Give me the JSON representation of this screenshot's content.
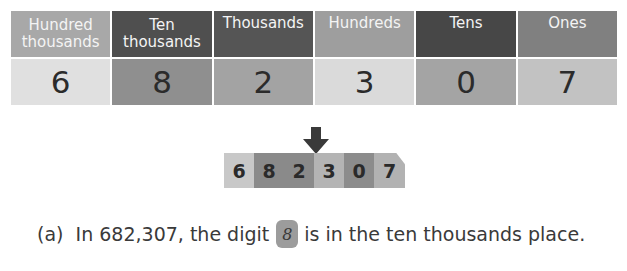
{
  "place_value_table": {
    "columns": [
      {
        "header": "Hundred thousands",
        "digit": "6",
        "header_color": "#a8a8a8",
        "cell_color": "#e0e0e0"
      },
      {
        "header": "Ten thousands",
        "digit": "8",
        "header_color": "#4f4f4f",
        "cell_color": "#8f8f8f"
      },
      {
        "header": "Thousands",
        "digit": "2",
        "header_color": "#555555",
        "cell_color": "#a3a3a3"
      },
      {
        "header": "Hundreds",
        "digit": "3",
        "header_color": "#9e9e9e",
        "cell_color": "#dadada"
      },
      {
        "header": "Tens",
        "digit": "0",
        "header_color": "#474747",
        "cell_color": "#a4a4a4"
      },
      {
        "header": "Ones",
        "digit": "7",
        "header_color": "#808080",
        "cell_color": "#c2c2c2"
      }
    ]
  },
  "digit_strip": {
    "cells": [
      {
        "digit": "6",
        "color": "#c8c8c8"
      },
      {
        "digit": "8",
        "color": "#8a8a8a"
      },
      {
        "digit": "2",
        "color": "#8a8a8a"
      },
      {
        "digit": "3",
        "color": "#b4b4b4"
      },
      {
        "digit": "0",
        "color": "#8c8c8c"
      },
      {
        "digit": "7",
        "color": "#b2b2b2"
      }
    ],
    "arrow_color": "#3a3a3a"
  },
  "question": {
    "label": "(a)",
    "prefix": "In 682,307, the digit",
    "answer": "8",
    "suffix": "is in the ten thousands place."
  }
}
